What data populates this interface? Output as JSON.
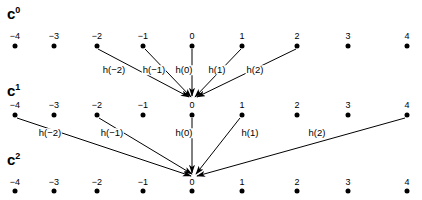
{
  "figure": {
    "background_color": "#ffffff",
    "ink_color": "#000000",
    "rows": [
      {
        "id": "c0",
        "label_base": "c",
        "label_exponent": "0",
        "ticks": [
          "−4",
          "−3",
          "−2",
          "−1",
          "0",
          "1",
          "2",
          "3",
          "4"
        ]
      },
      {
        "id": "c1",
        "label_base": "c",
        "label_exponent": "1",
        "ticks": [
          "−4",
          "−3",
          "−2",
          "−1",
          "0",
          "1",
          "2",
          "3",
          "4"
        ]
      },
      {
        "id": "c2",
        "label_base": "c",
        "label_exponent": "2",
        "ticks": [
          "−4",
          "−3",
          "−2",
          "−1",
          "0",
          "1",
          "2",
          "3",
          "4"
        ]
      }
    ],
    "stage1_filter_labels": [
      "h(−2)",
      "h(−1)",
      "h(0)",
      "h(1)",
      "h(2)"
    ],
    "stage2_filter_labels": [
      "h(−2)",
      "h(−1)",
      "h(0)",
      "h(1)",
      "h(2)"
    ]
  }
}
